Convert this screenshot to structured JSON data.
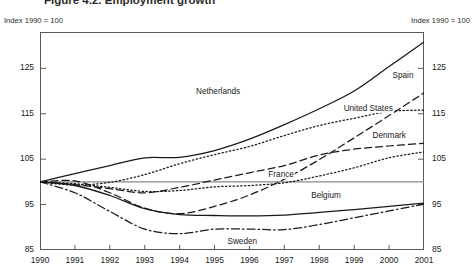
{
  "figure": {
    "title": "Figure 4.2. Employment growth",
    "note_left": "Index 1990 = 100",
    "note_right": "Index 1990 = 100"
  },
  "chart_data": {
    "type": "line",
    "title": "Figure 4.2. Employment growth",
    "xlabel": "",
    "ylabel": "Index 1990 = 100",
    "xlim": [
      1990,
      2001
    ],
    "ylim": [
      85,
      133
    ],
    "yticks": [
      85,
      95,
      105,
      115,
      125
    ],
    "ytick_labels": [
      "85",
      "95",
      "105",
      "115",
      "125"
    ],
    "grid": false,
    "reference_line": 100,
    "legend": "inline-labels",
    "x": [
      1990,
      1991,
      1992,
      1993,
      1994,
      1995,
      1996,
      1997,
      1998,
      1999,
      2000,
      2001
    ],
    "categories": [
      "1990",
      "1991",
      "1992",
      "1993",
      "1994",
      "1995",
      "1996",
      "1997",
      "1998",
      "1999",
      "2000",
      "2001"
    ],
    "series": [
      {
        "name": "Netherlands",
        "style": "solid",
        "label_x": 1995.1,
        "label_y": 119.5,
        "values": [
          100.0,
          101.8,
          103.6,
          105.3,
          105.4,
          106.9,
          109.4,
          112.6,
          116.1,
          120.0,
          125.4,
          130.8
        ]
      },
      {
        "name": "Spain",
        "style": "dashed",
        "label_x": 2000.4,
        "label_y": 123.0,
        "values": [
          100.0,
          100.2,
          97.6,
          94.2,
          93.0,
          94.6,
          97.1,
          100.6,
          104.9,
          109.7,
          114.6,
          119.6
        ]
      },
      {
        "name": "United States",
        "style": "dotted",
        "label_x": 1999.4,
        "label_y": 115.8,
        "values": [
          100.0,
          99.3,
          99.9,
          101.6,
          104.0,
          106.0,
          107.8,
          110.2,
          112.4,
          114.0,
          115.5,
          115.8
        ]
      },
      {
        "name": "Denmark",
        "style": "dashed",
        "label_x": 2000.0,
        "label_y": 109.8,
        "values": [
          100.0,
          99.4,
          98.5,
          97.6,
          98.8,
          100.4,
          102.0,
          103.6,
          105.9,
          107.2,
          107.9,
          108.5
        ]
      },
      {
        "name": "France",
        "style": "dotted",
        "label_x": 1996.9,
        "label_y": 101.4,
        "values": [
          100.0,
          99.6,
          98.8,
          97.9,
          98.1,
          98.9,
          99.2,
          99.8,
          101.3,
          103.1,
          105.3,
          106.6
        ]
      },
      {
        "name": "Belgium",
        "style": "solid",
        "label_x": 1998.2,
        "label_y": 96.7,
        "values": [
          100.0,
          99.2,
          97.0,
          94.1,
          92.8,
          92.6,
          92.5,
          92.7,
          93.3,
          93.9,
          94.6,
          95.3
        ]
      },
      {
        "name": "Sweden",
        "style": "dash-dot",
        "label_x": 1995.8,
        "label_y": 86.6,
        "values": [
          100.0,
          97.6,
          93.5,
          89.6,
          88.6,
          89.6,
          89.6,
          89.5,
          90.6,
          92.1,
          93.6,
          95.1
        ]
      }
    ]
  }
}
